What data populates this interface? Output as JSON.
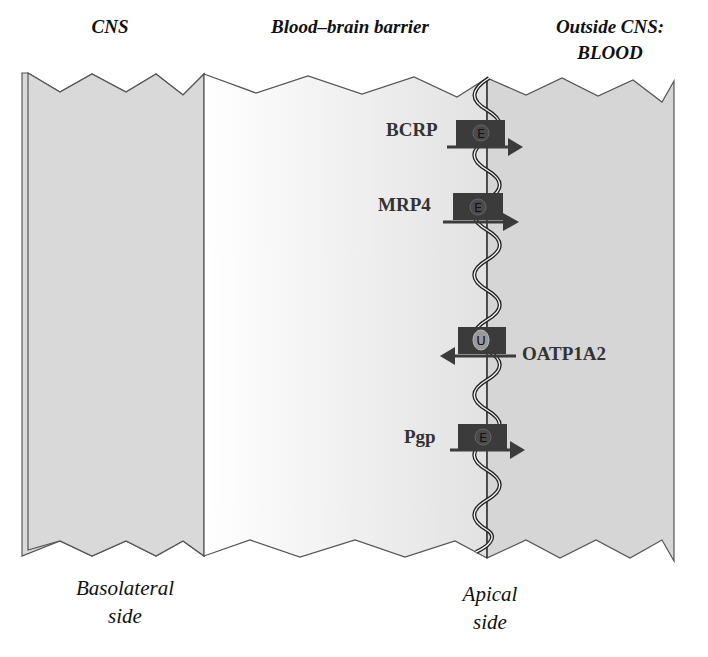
{
  "titles": {
    "cns": "CNS",
    "bbb": "Blood–brain barrier",
    "blood_line1": "Outside CNS:",
    "blood_line2": "BLOOD"
  },
  "side_labels": {
    "basolateral_line1": "Basolateral",
    "basolateral_line2": "side",
    "apical_line1": "Apical",
    "apical_line2": "side"
  },
  "transporters": [
    {
      "name": "BCRP",
      "badge": "E",
      "direction": "efflux",
      "arrow": "right"
    },
    {
      "name": "MRP4",
      "badge": "E",
      "direction": "efflux",
      "arrow": "right"
    },
    {
      "name": "OATP1A2",
      "badge": "U",
      "direction": "uptake",
      "arrow": "left"
    },
    {
      "name": "Pgp",
      "badge": "E",
      "direction": "efflux",
      "arrow": "right"
    }
  ],
  "colors": {
    "cns_fill": "#d9d9d9",
    "blood_fill": "#d6d6d6",
    "bbb_fill_left": "#ffffff",
    "bbb_fill_right": "#e4e4e4",
    "outline": "#555555",
    "transporter_box": "#3b3b3b",
    "badge_e": "#4a4a4a",
    "badge_u": "#9a9a9a"
  }
}
